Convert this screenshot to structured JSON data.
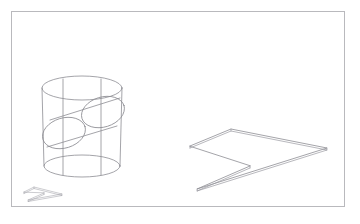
{
  "figure": {
    "background_color": "#ffffff",
    "frame": {
      "name": "figure-border",
      "x": 11,
      "y": 11,
      "width": 334,
      "height": 196,
      "stroke_color": "#b9b9bd",
      "stroke_width": 1
    },
    "line_color": "#8d8d93",
    "line_width": 0.8,
    "objects": [
      {
        "name": "vertical-cylinder",
        "label": "Vertical cylinder",
        "center_x": 82,
        "top_ellipse": {
          "cx": 82,
          "cy": 88,
          "rx": 40,
          "ry": 12
        },
        "bottom_ellipse": {
          "cx": 82,
          "cy": 166,
          "rx": 38,
          "ry": 11
        },
        "vertical_edges_x": [
          44,
          63,
          101,
          120
        ]
      },
      {
        "name": "tilted-cylinder",
        "label": "Tilted cylinder passing through",
        "axis_start": {
          "x": 64,
          "y": 133
        },
        "axis_end": {
          "x": 103,
          "y": 113
        },
        "cap_radius_major": 21,
        "cap_radius_minor": 14,
        "cap_rotation_deg": -27
      },
      {
        "name": "chevron-prism",
        "label": "Chevron arrow slab",
        "top_face_vertices": [
          {
            "x": 190,
            "y": 146
          },
          {
            "x": 231,
            "y": 129
          },
          {
            "x": 327,
            "y": 148
          },
          {
            "x": 197,
            "y": 189
          },
          {
            "x": 250,
            "y": 166
          }
        ]
      },
      {
        "name": "mini-chevron",
        "label": "Miniature chevron copy",
        "x": 22,
        "y": 185,
        "width": 40,
        "height": 16
      }
    ]
  },
  "chart_data": {
    "type": "line",
    "xlabel": "",
    "ylabel": "",
    "xlim": [
      0,
      360
    ],
    "ylim": [
      0,
      224
    ],
    "grid": false,
    "legend": "none",
    "series": [
      {
        "name": "vertical-cylinder-top-ellipse",
        "shape": "ellipse",
        "cx": 82,
        "cy": 88,
        "rx": 40,
        "ry": 12
      },
      {
        "name": "vertical-cylinder-bottom-ellipse",
        "shape": "ellipse",
        "cx": 82,
        "cy": 166,
        "rx": 38,
        "ry": 11
      },
      {
        "name": "vertical-cylinder-edge-left-outer",
        "shape": "line",
        "x": [
          44,
          44
        ],
        "y": [
          88,
          166
        ]
      },
      {
        "name": "vertical-cylinder-edge-left-inner",
        "shape": "line",
        "x": [
          63,
          63
        ],
        "y": [
          78,
          176
        ]
      },
      {
        "name": "vertical-cylinder-edge-right-inner",
        "shape": "line",
        "x": [
          101,
          101
        ],
        "y": [
          78,
          176
        ]
      },
      {
        "name": "vertical-cylinder-edge-right-outer",
        "shape": "line",
        "x": [
          120,
          120
        ],
        "y": [
          88,
          166
        ]
      },
      {
        "name": "tilted-cylinder-near-cap",
        "shape": "ellipse",
        "cx": 64,
        "cy": 133,
        "rx": 21,
        "ry": 14,
        "rotation": -27
      },
      {
        "name": "tilted-cylinder-far-cap",
        "shape": "ellipse",
        "cx": 103,
        "cy": 113,
        "rx": 21,
        "ry": 14,
        "rotation": -27
      },
      {
        "name": "tilted-cylinder-upper-edge",
        "shape": "line",
        "x": [
          52,
          118
        ],
        "y": [
          121,
          100
        ]
      },
      {
        "name": "tilted-cylinder-lower-edge",
        "shape": "line",
        "x": [
          48,
          115
        ],
        "y": [
          146,
          126
        ]
      },
      {
        "name": "chevron-top-face",
        "shape": "polygon",
        "x": [
          190,
          231,
          327,
          197,
          250
        ],
        "y": [
          146,
          129,
          148,
          189,
          166
        ]
      },
      {
        "name": "chevron-bottom-face",
        "shape": "polygon",
        "x": [
          190,
          231,
          327,
          197,
          250
        ],
        "y": [
          149,
          132,
          151,
          192,
          169
        ]
      },
      {
        "name": "mini-chevron-copy",
        "shape": "polygon",
        "x": [
          24,
          34,
          62,
          28,
          44
        ],
        "y": [
          192,
          187,
          194,
          200,
          193
        ]
      }
    ]
  }
}
